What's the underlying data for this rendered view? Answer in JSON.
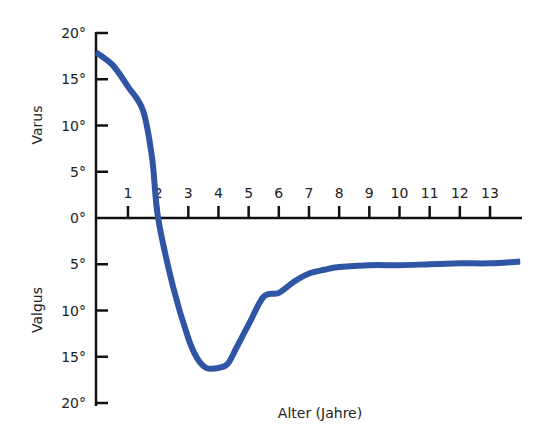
{
  "chart_data": {
    "type": "line",
    "title": "",
    "xlabel": "Alter (Jahre)",
    "ylabel_top": "Varus",
    "ylabel_bottom": "Valgus",
    "x_ticks": [
      "1",
      "2",
      "3",
      "4",
      "5",
      "6",
      "7",
      "8",
      "9",
      "10",
      "11",
      "12",
      "13"
    ],
    "y_ticks": [
      "20°",
      "15°",
      "10°",
      "5°",
      "0°",
      "5°",
      "10°",
      "15°",
      "20°"
    ],
    "y_tick_values": [
      20,
      15,
      10,
      5,
      0,
      -5,
      -10,
      -15,
      -20
    ],
    "xlim": [
      0,
      14
    ],
    "ylim": [
      -20,
      20
    ],
    "grid": false,
    "line_color": "#2f55a4",
    "series": [
      {
        "name": "Beinachse",
        "x": [
          0,
          0.5,
          1.0,
          1.5,
          1.8,
          2.0,
          2.5,
          3.0,
          3.3,
          3.6,
          4.0,
          4.3,
          4.6,
          5.0,
          5.5,
          6.0,
          6.5,
          7.0,
          7.5,
          8.0,
          9.0,
          10.0,
          11.0,
          12.0,
          13.0,
          14.0
        ],
        "y": [
          17.9,
          16.5,
          14.2,
          11.6,
          6.5,
          0,
          -7.5,
          -13.0,
          -15.2,
          -16.2,
          -16.2,
          -15.8,
          -14.0,
          -11.5,
          -8.5,
          -8.1,
          -6.9,
          -6.0,
          -5.6,
          -5.3,
          -5.1,
          -5.1,
          -5.0,
          -4.9,
          -4.9,
          -4.7
        ]
      }
    ]
  }
}
